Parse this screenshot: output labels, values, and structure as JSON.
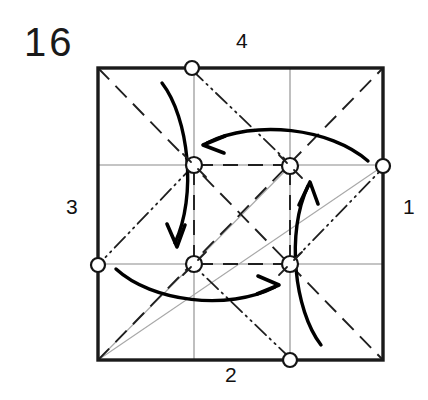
{
  "figure": {
    "step_number": "16",
    "type": "origami-crease-pattern",
    "edge_labels": {
      "top": "4",
      "right": "1",
      "bottom": "2",
      "left": "3"
    }
  },
  "colors": {
    "paper_edge": "#1a1a1a",
    "grid_line": "#808080",
    "valley_fold": "#1a1a1a",
    "mountain_fold": "#1a1a1a",
    "reference_diagonal": "#9a9a9a",
    "arrow": "#000000",
    "background": "#ffffff",
    "marker_ring": "#111111"
  },
  "chart_data": {
    "type": "diagram",
    "title": "16",
    "square": {
      "x0": 98,
      "y0": 68,
      "x1": 383,
      "y1": 360
    },
    "grid_divisions": 3,
    "grid_lines": [
      {
        "name": "vertical-third-1",
        "orientation": "vertical",
        "at": 194,
        "style": "thin-solid"
      },
      {
        "name": "vertical-third-2",
        "orientation": "vertical",
        "at": 290,
        "style": "thin-solid"
      },
      {
        "name": "horizontal-third-1",
        "orientation": "horizontal",
        "at": 165,
        "style": "thin-solid"
      },
      {
        "name": "horizontal-third-2",
        "orientation": "horizontal",
        "at": 264,
        "style": "thin-solid"
      }
    ],
    "markers": [
      {
        "name": "marker-top-center",
        "x": 192,
        "y": 68,
        "r": 7
      },
      {
        "name": "marker-right-edge",
        "x": 383,
        "y": 166,
        "r": 7
      },
      {
        "name": "marker-bottom-center",
        "x": 290,
        "y": 360,
        "r": 7
      },
      {
        "name": "marker-left-edge",
        "x": 98,
        "y": 265,
        "r": 7
      },
      {
        "name": "marker-inner-tl",
        "x": 194,
        "y": 165,
        "r": 8
      },
      {
        "name": "marker-inner-tr",
        "x": 290,
        "y": 166,
        "r": 8
      },
      {
        "name": "marker-inner-bl",
        "x": 194,
        "y": 264,
        "r": 8
      },
      {
        "name": "marker-inner-br",
        "x": 290,
        "y": 264,
        "r": 8
      }
    ],
    "valley_folds": [
      {
        "name": "valley-tl-to-br",
        "x1": 98,
        "y1": 68,
        "x2": 383,
        "y2": 360
      },
      {
        "name": "valley-bl-to-tr",
        "x1": 98,
        "y1": 360,
        "x2": 383,
        "y2": 68
      },
      {
        "name": "valley-inner-top",
        "x1": 194,
        "y1": 165,
        "x2": 290,
        "y2": 166
      },
      {
        "name": "valley-inner-bottom",
        "x1": 194,
        "y1": 264,
        "x2": 290,
        "y2": 264
      },
      {
        "name": "valley-inner-left",
        "x1": 194,
        "y1": 165,
        "x2": 194,
        "y2": 264
      },
      {
        "name": "valley-inner-right",
        "x1": 290,
        "y1": 166,
        "x2": 290,
        "y2": 264
      }
    ],
    "mountain_folds": [
      {
        "name": "mountain-topcenter-to-innertr",
        "x1": 192,
        "y1": 68,
        "x2": 290,
        "y2": 166
      },
      {
        "name": "mountain-innerbr-to-rightedge",
        "x1": 290,
        "y1": 264,
        "x2": 383,
        "y2": 166
      },
      {
        "name": "mountain-bottomcenter-to-innerbl",
        "x1": 290,
        "y1": 360,
        "x2": 194,
        "y2": 264
      },
      {
        "name": "mountain-innertl-to-leftedge",
        "x1": 194,
        "y1": 165,
        "x2": 98,
        "y2": 265
      }
    ],
    "reference_lines": [
      {
        "name": "ref-diagonal-bl-to-innertr",
        "x1": 98,
        "y1": 360,
        "x2": 290,
        "y2": 166
      },
      {
        "name": "ref-diagonal-bl-to-rightedge",
        "x1": 98,
        "y1": 360,
        "x2": 383,
        "y2": 166
      }
    ],
    "arrows": [
      {
        "name": "arrow-top-right-to-left",
        "direction": "leftward",
        "description": "curved arrow sweeping from right edge toward inner-top-left point"
      },
      {
        "name": "arrow-left-top-to-down",
        "direction": "downward",
        "description": "curved arrow sweeping from top edge down to inner-bottom-left point"
      },
      {
        "name": "arrow-bottom-left-to-right",
        "direction": "rightward",
        "description": "curved arrow sweeping from left edge toward inner-bottom-right point"
      },
      {
        "name": "arrow-right-bottom-to-up",
        "direction": "upward",
        "description": "curved arrow sweeping from bottom edge up to inner-top-right point"
      }
    ],
    "rotation": "four-fold rotational symmetry (pinwheel / twist fold)"
  }
}
